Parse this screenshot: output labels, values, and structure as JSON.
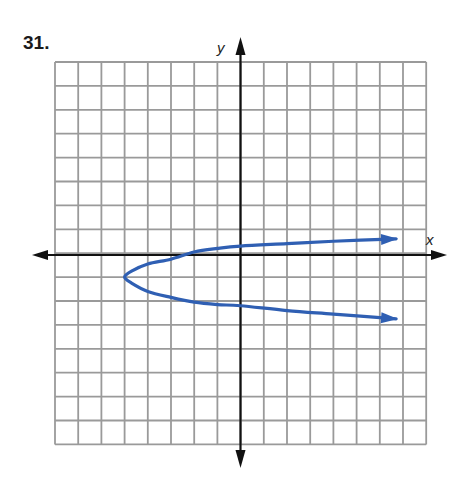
{
  "problem": {
    "number": "31."
  },
  "chart_data": {
    "type": "line",
    "title": "",
    "xlabel": "x",
    "ylabel": "y",
    "grid": true,
    "xlim": [
      -8,
      8
    ],
    "ylim": [
      -8,
      8
    ],
    "grid_step": 1,
    "tick_labels": false,
    "series": [
      {
        "name": "sideways parabola (opens right)",
        "color": "#2f5fb3",
        "vertex": [
          -5,
          -1
        ],
        "arrows_on_both_ends": true,
        "points": [
          [
            6.7,
            0.6
          ],
          [
            4,
            0.5
          ],
          [
            2,
            0.4
          ],
          [
            0,
            0.3
          ],
          [
            -1,
            0.2
          ],
          [
            -2,
            0.05
          ],
          [
            -3,
            -0.25
          ],
          [
            -4,
            -0.45
          ],
          [
            -4.7,
            -0.75
          ],
          [
            -5,
            -1
          ],
          [
            -4.7,
            -1.25
          ],
          [
            -4,
            -1.6
          ],
          [
            -3,
            -1.85
          ],
          [
            -2,
            -2.05
          ],
          [
            -1,
            -2.15
          ],
          [
            0,
            -2.2
          ],
          [
            2,
            -2.4
          ],
          [
            4,
            -2.55
          ],
          [
            6.7,
            -2.75
          ]
        ]
      }
    ],
    "colors": {
      "grid": "#9a9a9a",
      "axes": "#111111",
      "curve": "#2f5fb3"
    }
  }
}
